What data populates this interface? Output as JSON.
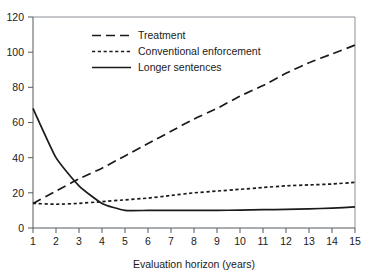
{
  "chart_data": {
    "type": "line",
    "title": "",
    "xlabel": "Evaluation horizon (years)",
    "ylabel": "",
    "xlim": [
      1,
      15
    ],
    "ylim": [
      0,
      120
    ],
    "grid": false,
    "legend_position": "top-left-inside",
    "x": [
      1,
      2,
      3,
      4,
      5,
      6,
      7,
      8,
      9,
      10,
      11,
      12,
      13,
      14,
      15
    ],
    "xtick_labels": [
      "1",
      "2",
      "3",
      "4",
      "5",
      "6",
      "7",
      "8",
      "9",
      "10",
      "11",
      "12",
      "13",
      "14",
      "15"
    ],
    "ytick_labels": [
      "0",
      "20",
      "40",
      "60",
      "80",
      "100",
      "120"
    ],
    "yticks": [
      0,
      20,
      40,
      60,
      80,
      100,
      120
    ],
    "series": [
      {
        "name": "Treatment",
        "style": "long-dash",
        "values": [
          14,
          21,
          28,
          34,
          41,
          48,
          55,
          62,
          68,
          75,
          81,
          88,
          94,
          99,
          104
        ]
      },
      {
        "name": "Conventional enforcement",
        "style": "short-dash",
        "values": [
          14,
          13.5,
          14,
          15,
          16,
          17,
          18.5,
          20,
          21,
          22,
          23,
          24,
          24.5,
          25,
          26
        ]
      },
      {
        "name": "Longer sentences",
        "style": "solid",
        "values": [
          68,
          40,
          24,
          14,
          10,
          10,
          10,
          10,
          10,
          10.2,
          10.4,
          10.6,
          10.9,
          11.3,
          12
        ]
      }
    ]
  },
  "legend": {
    "entries": [
      {
        "label": "Treatment",
        "style": "long-dash"
      },
      {
        "label": "Conventional enforcement",
        "style": "short-dash"
      },
      {
        "label": "Longer sentences",
        "style": "solid"
      }
    ]
  },
  "axes": {
    "x_title": "Evaluation horizon (years)"
  },
  "colors": {
    "line": "#1a1a1a",
    "axis": "#555a5e",
    "frame": "#8c9196",
    "background": "#ffffff"
  }
}
